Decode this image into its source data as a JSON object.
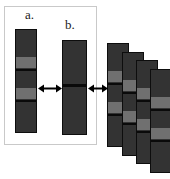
{
  "figure": {
    "background_color": "#ffffff",
    "width": 170,
    "height": 179,
    "panel": {
      "name": "framed-panel",
      "border_color": "#c9c9c9",
      "x": 4,
      "y": 6,
      "w": 93,
      "h": 139
    },
    "labels": [
      {
        "id": "label-a",
        "text": "a.",
        "x": 25,
        "y": 8
      },
      {
        "id": "label-b",
        "text": "b.",
        "x": 65,
        "y": 18
      }
    ],
    "colors": {
      "lane_fill": "#333333",
      "lane_border": "#0d0d0d",
      "band_light": "#707070",
      "band_dark": "#0a0a0a",
      "arrow": "#000000",
      "frame": "#c9c9c9"
    },
    "lanes": [
      {
        "id": "lane-a",
        "label": "a.",
        "x": 15,
        "y": 29,
        "w": 22,
        "h": 104,
        "bands": [
          {
            "type": "light",
            "top": 27,
            "height": 11
          },
          {
            "type": "dark",
            "top": 39,
            "height": 2
          },
          {
            "type": "light",
            "top": 58,
            "height": 11
          },
          {
            "type": "dark",
            "top": 70,
            "height": 2
          }
        ]
      },
      {
        "id": "lane-b",
        "label": "b.",
        "x": 62,
        "y": 40,
        "w": 25,
        "h": 95,
        "bands": [
          {
            "type": "dark",
            "top": 43,
            "height": 3
          }
        ]
      },
      {
        "id": "lane-stack-1",
        "label": "",
        "x": 107,
        "y": 43,
        "w": 22,
        "h": 104,
        "bands": [
          {
            "type": "light",
            "top": 27,
            "height": 11
          },
          {
            "type": "dark",
            "top": 39,
            "height": 2
          },
          {
            "type": "light",
            "top": 58,
            "height": 11
          },
          {
            "type": "dark",
            "top": 70,
            "height": 2
          }
        ]
      },
      {
        "id": "lane-stack-2",
        "label": "",
        "x": 122,
        "y": 52,
        "w": 22,
        "h": 104,
        "bands": [
          {
            "type": "light",
            "top": 27,
            "height": 11
          },
          {
            "type": "dark",
            "top": 39,
            "height": 2
          },
          {
            "type": "light",
            "top": 58,
            "height": 11
          },
          {
            "type": "dark",
            "top": 70,
            "height": 2
          }
        ]
      },
      {
        "id": "lane-stack-3",
        "label": "",
        "x": 136,
        "y": 60,
        "w": 22,
        "h": 104,
        "bands": [
          {
            "type": "light",
            "top": 27,
            "height": 11
          },
          {
            "type": "dark",
            "top": 39,
            "height": 2
          },
          {
            "type": "light",
            "top": 58,
            "height": 11
          },
          {
            "type": "dark",
            "top": 70,
            "height": 2
          }
        ]
      },
      {
        "id": "lane-stack-4",
        "label": "",
        "x": 150,
        "y": 69,
        "w": 22,
        "h": 104,
        "bands": [
          {
            "type": "light",
            "top": 27,
            "height": 11
          },
          {
            "type": "dark",
            "top": 39,
            "height": 2
          },
          {
            "type": "light",
            "top": 58,
            "height": 11
          },
          {
            "type": "dark",
            "top": 70,
            "height": 2
          }
        ]
      }
    ],
    "arrows": [
      {
        "id": "arrow-a-b",
        "x": 38,
        "y": 83,
        "w": 24
      },
      {
        "id": "arrow-b-stack",
        "x": 88,
        "y": 83,
        "w": 20
      }
    ]
  }
}
